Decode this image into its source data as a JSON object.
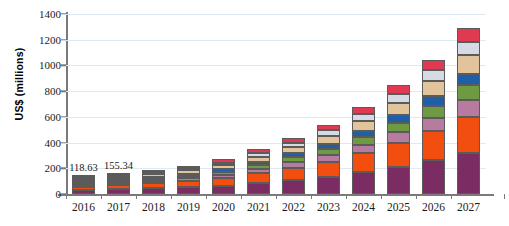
{
  "chart_data": {
    "type": "bar",
    "stacked": true,
    "title": "",
    "subtitle": "",
    "xlabel": "",
    "ylabel": "US$ (millions)",
    "ylim": [
      0,
      1400
    ],
    "yticks": [
      0,
      200,
      400,
      600,
      800,
      1000,
      1200,
      1400
    ],
    "ytick_labels": [
      "0",
      "200",
      "400",
      "600",
      "800",
      "1000",
      "1200",
      "1400"
    ],
    "grid": true,
    "legend": "none",
    "categories": [
      "2016",
      "2017",
      "2018",
      "2019",
      "2020",
      "2021",
      "2022",
      "2023",
      "2024",
      "2025",
      "2026",
      "2027"
    ],
    "totals": [
      118.63,
      155.34,
      180.0,
      218.0,
      272.0,
      348.0,
      438.0,
      540.0,
      680.0,
      845.0,
      1045.0,
      1290.0
    ],
    "annotations": [
      {
        "category": "2016",
        "text": "118.63"
      },
      {
        "category": "2017",
        "text": "155.34"
      }
    ],
    "series": [
      {
        "name": "series-1",
        "color": "#7B2D63",
        "values": [
          30,
          38,
          44,
          54,
          66,
          86,
          108,
          134,
          170,
          212,
          262,
          322
        ]
      },
      {
        "name": "series-2",
        "color": "#F24E10",
        "values": [
          26,
          33,
          38,
          47,
          57,
          74,
          94,
          116,
          146,
          182,
          226,
          278
        ]
      },
      {
        "name": "series-3",
        "color": "#B87BA0",
        "values": [
          12,
          16,
          18,
          22,
          27,
          35,
          44,
          54,
          68,
          85,
          105,
          129
        ]
      },
      {
        "name": "series-4",
        "color": "#6E9A43",
        "values": [
          11,
          14,
          16,
          20,
          24,
          31,
          39,
          49,
          61,
          76,
          94,
          116
        ]
      },
      {
        "name": "series-5",
        "color": "#1F5FA8",
        "values": [
          8,
          10,
          12,
          15,
          19,
          24,
          31,
          38,
          48,
          59,
          73,
          90
        ]
      },
      {
        "name": "series-6",
        "color": "#E2C49C",
        "values": [
          14,
          18,
          21,
          25,
          31,
          40,
          51,
          62,
          79,
          98,
          121,
          149
        ]
      },
      {
        "name": "series-7",
        "color": "#D6DAE4",
        "values": [
          9,
          12,
          14,
          17,
          21,
          27,
          34,
          42,
          53,
          66,
          81,
          100
        ]
      },
      {
        "name": "series-8",
        "color": "#E03A52",
        "values": [
          8.63,
          14.34,
          17,
          18,
          27,
          31,
          37,
          45,
          55,
          67,
          83,
          106
        ]
      }
    ]
  }
}
